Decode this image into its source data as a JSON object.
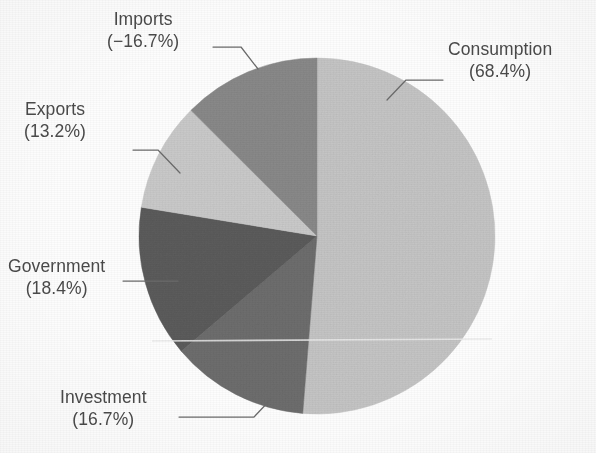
{
  "figure": {
    "kind": "pie-chart",
    "background": "#fdfdfd",
    "text_color": "#4a4a4a",
    "width": 596,
    "height": 453
  },
  "chart_data": {
    "type": "pie",
    "title": "",
    "subtitle": "",
    "xlabel": "",
    "ylabel": "",
    "legend_position": "none",
    "grid": false,
    "labels_outside": true,
    "start_angle_deg": 0,
    "direction": "clockwise",
    "note": "Slice angles are proportional to the absolute value of each component; Imports is a negative contribution shown at its absolute magnitude.",
    "categories": [
      "Consumption",
      "Investment",
      "Government",
      "Exports",
      "Imports"
    ],
    "values": [
      68.4,
      16.7,
      18.4,
      13.2,
      -16.7
    ],
    "abs_values": [
      68.4,
      16.7,
      18.4,
      13.2,
      16.7
    ],
    "value_unit": "%",
    "sum_abs": 133.4,
    "slices": [
      {
        "name": "Consumption",
        "label": "Consumption",
        "value_text": "(68.4%)",
        "value": 68.4,
        "abs_value": 68.4,
        "color": "#c6c6c6",
        "start_deg": 0,
        "end_deg": 184.6,
        "sweep_deg": 184.6,
        "share_of_total": 51.3
      },
      {
        "name": "Investment",
        "label": "Investment",
        "value_text": "(16.7%)",
        "value": 16.7,
        "abs_value": 16.7,
        "color": "#6e6e6e",
        "start_deg": 184.6,
        "end_deg": 229.7,
        "sweep_deg": 45.1,
        "share_of_total": 12.5
      },
      {
        "name": "Government",
        "label": "Government",
        "value_text": "(18.4%)",
        "value": 18.4,
        "abs_value": 18.4,
        "color": "#5c5c5c",
        "start_deg": 229.7,
        "end_deg": 279.3,
        "sweep_deg": 49.6,
        "share_of_total": 13.8
      },
      {
        "name": "Exports",
        "label": "Exports",
        "value_text": "(13.2%)",
        "value": 13.2,
        "abs_value": 13.2,
        "color": "#cbcbcb",
        "start_deg": 279.3,
        "end_deg": 314.9,
        "sweep_deg": 35.6,
        "share_of_total": 9.9
      },
      {
        "name": "Imports",
        "label": "Imports",
        "value_text": "(−16.7%)",
        "value": -16.7,
        "abs_value": 16.7,
        "color": "#8a8a8a",
        "start_deg": 314.9,
        "end_deg": 360,
        "sweep_deg": 45.1,
        "share_of_total": 12.5
      }
    ],
    "geometry": {
      "center_x": 317,
      "center_y": 236,
      "radius": 178
    }
  },
  "labels": {
    "consumption": {
      "name": "Consumption",
      "value": "(68.4%)"
    },
    "imports": {
      "name": "Imports",
      "value": "(−16.7%)"
    },
    "exports": {
      "name": "Exports",
      "value": "(13.2%)"
    },
    "government": {
      "name": "Government",
      "value": "(18.4%)"
    },
    "investment": {
      "name": "Investment",
      "value": "(16.7%)"
    }
  }
}
